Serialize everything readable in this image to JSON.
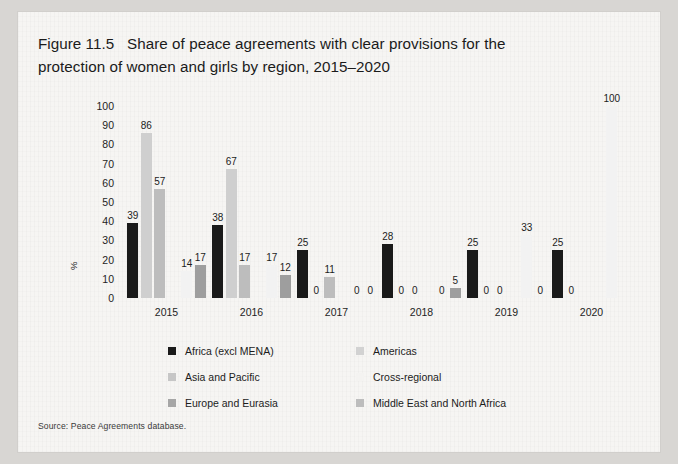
{
  "figure": {
    "title_line1": "Figure 11.5   Share of peace agreements with clear provisions for the",
    "title_line2": "protection of women and girls by region, 2015–2020",
    "source": "Source: Peace Agreements database."
  },
  "chart_data": {
    "type": "bar",
    "title": "Figure 11.5   Share of peace agreements with clear provisions for the protection of women and girls by region, 2015–2020",
    "xlabel": "",
    "ylabel": "%",
    "ylim": [
      0,
      100
    ],
    "yticks": [
      0,
      10,
      20,
      30,
      40,
      50,
      60,
      70,
      80,
      90,
      100
    ],
    "grid": false,
    "legend_position": "bottom",
    "categories": [
      "2015",
      "2016",
      "2017",
      "2018",
      "2019",
      "2020"
    ],
    "series": [
      {
        "name": "Africa (excl MENA)",
        "color": "#1a1a1a",
        "values": [
          39,
          38,
          25,
          28,
          25,
          25
        ]
      },
      {
        "name": "Americas",
        "color": "#cfcfcf",
        "values": [
          86,
          67,
          0,
          0,
          0,
          0
        ]
      },
      {
        "name": "Asia and Pacific",
        "color": "#bdbdbd",
        "values": [
          57,
          17,
          11,
          0,
          0,
          null
        ]
      },
      {
        "name": "Cross-regional",
        "color": "#f2f2f2",
        "values": [
          14,
          17,
          0,
          0,
          33,
          100
        ]
      },
      {
        "name": "Europe and Eurasia",
        "color": "#9e9e9e",
        "values": [
          17,
          12,
          0,
          5,
          0,
          null
        ]
      },
      {
        "name": "Middle East and North Africa",
        "color": "#b5b5b5",
        "values": [
          null,
          null,
          null,
          null,
          null,
          null
        ]
      }
    ],
    "annotations": {
      "2015": [
        "39",
        "86",
        "57",
        "14",
        "17"
      ],
      "2016": [
        "38",
        "67",
        "17",
        "17",
        "12"
      ],
      "2017": [
        "25",
        "0",
        "11",
        "0",
        "0"
      ],
      "2018": [
        "28",
        "0",
        "0",
        "0",
        "5"
      ],
      "2019": [
        "25",
        "0",
        "0",
        "33",
        "0"
      ],
      "2020": [
        "25",
        "0",
        "100"
      ]
    }
  },
  "legend": {
    "items": [
      {
        "label": "Africa (excl MENA)",
        "color": "#1a1a1a"
      },
      {
        "label": "Americas",
        "color": "#d2d2d2"
      },
      {
        "label": "Asia and Pacific",
        "color": "#c6c6c6"
      },
      {
        "label": "Cross-regional",
        "color": "#f4f3f1"
      },
      {
        "label": "Europe and Eurasia",
        "color": "#a6a6a6"
      },
      {
        "label": "Middle East and North Africa",
        "color": "#bdbdbd"
      }
    ]
  }
}
